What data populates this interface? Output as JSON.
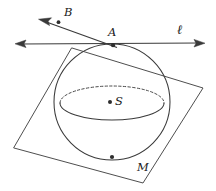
{
  "figure": {
    "background_color": "#ffffff",
    "stroke_color": "#3a3a3a",
    "label_color": "#202020",
    "width": 216,
    "height": 191
  },
  "labels": {
    "point_b": "B",
    "point_a": "A",
    "line_l": "ℓ",
    "center_s": "S",
    "point_m": "M"
  },
  "points": [
    {
      "name": "A",
      "label": "A",
      "x": 113,
      "y": 45,
      "role": "tangent-point-on-sphere"
    },
    {
      "name": "B",
      "label": "B",
      "x": 58,
      "y": 22,
      "role": "point-on-ray"
    },
    {
      "name": "S",
      "label": "S",
      "x": 110,
      "y": 102,
      "role": "sphere-center"
    },
    {
      "name": "M",
      "label": "M",
      "x": 112,
      "y": 157,
      "role": "point-on-sphere-bottom"
    }
  ],
  "sphere": {
    "center_x": 112,
    "center_y": 102,
    "radius": 58,
    "equator_rx": 52,
    "equator_ry": 17,
    "equator_cy": 103
  },
  "plane": {
    "name": "tangent-plane-quadrilateral",
    "corners": [
      {
        "x": 72,
        "y": 48
      },
      {
        "x": 203,
        "y": 88
      },
      {
        "x": 143,
        "y": 183
      },
      {
        "x": 14,
        "y": 148
      }
    ]
  },
  "line_l": {
    "name": "horizontal-line-l",
    "x1": 16,
    "y1": 44,
    "x2": 204,
    "y2": 43,
    "arrow_left": true,
    "arrow_right": true,
    "label_x": 181,
    "label_y": 30
  },
  "ray_b": {
    "name": "ray-through-A-and-B",
    "x1": 117,
    "y1": 47,
    "x2": 41,
    "y2": 20,
    "arrow_at_b_end": true,
    "label_x": 64,
    "label_y": 13
  }
}
